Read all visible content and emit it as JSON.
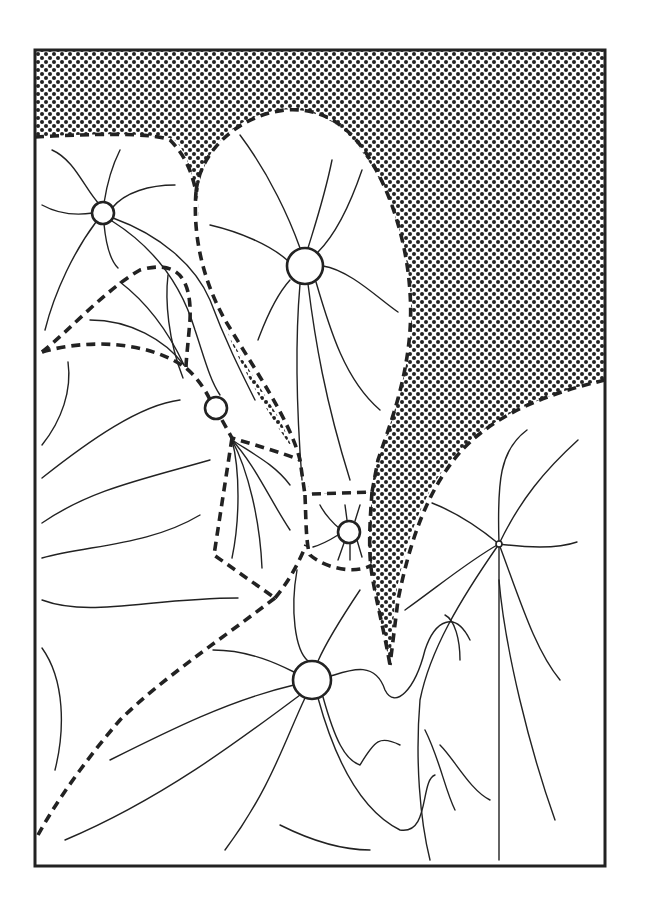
{
  "diagram": {
    "title": "",
    "frame": {
      "x": 35,
      "y": 50,
      "width": 570,
      "height": 816
    },
    "colors": {
      "ink": "#222222",
      "background": "#ffffff",
      "stipple": "#222222"
    },
    "shaded_region": {
      "pattern": "dot-stipple",
      "description": "stippled region top and right"
    },
    "nodes": [
      {
        "id": "node-top-left",
        "cx": 103,
        "cy": 213,
        "r": 11
      },
      {
        "id": "node-large-upper",
        "cx": 305,
        "cy": 266,
        "r": 18
      },
      {
        "id": "node-middle-left",
        "cx": 216,
        "cy": 408,
        "r": 11
      },
      {
        "id": "node-middle-small",
        "cx": 349,
        "cy": 532,
        "r": 11
      },
      {
        "id": "node-bottom-large",
        "cx": 312,
        "cy": 680,
        "r": 19
      },
      {
        "id": "node-right-tiny",
        "cx": 499,
        "cy": 544,
        "r": 3
      }
    ],
    "labels": []
  }
}
